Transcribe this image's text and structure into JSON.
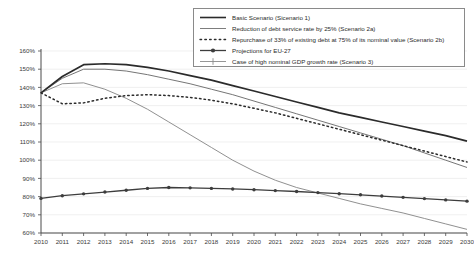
{
  "chart_data": {
    "type": "line",
    "title": "",
    "xlabel": "",
    "ylabel": "",
    "x": [
      2010,
      2011,
      2012,
      2013,
      2014,
      2015,
      2016,
      2017,
      2018,
      2019,
      2020,
      2021,
      2022,
      2023,
      2024,
      2025,
      2026,
      2027,
      2028,
      2029,
      2030
    ],
    "xlim": [
      2010,
      2030
    ],
    "ylim": [
      60,
      160
    ],
    "ytick_labels": [
      "160%",
      "150%",
      "140%",
      "130%",
      "120%",
      "110%",
      "100%",
      "90%",
      "80%",
      "70%",
      "60%"
    ],
    "ytick_values": [
      160,
      150,
      140,
      130,
      120,
      110,
      100,
      90,
      80,
      70,
      60
    ],
    "xtick_labels": [
      "2010",
      "2011",
      "2012",
      "2013",
      "2014",
      "2015",
      "2016",
      "2017",
      "2018",
      "2019",
      "2020",
      "2021",
      "2022",
      "2023",
      "2024",
      "2025",
      "2026",
      "2027",
      "2028",
      "2029",
      "2030"
    ],
    "grid": true,
    "legend_position": "top-right",
    "series": [
      {
        "name": "Basic Scenario (Sicenario 1)",
        "style": "solid-thick",
        "color": "#2b2b2b",
        "values": [
          137.0,
          146.0,
          152.5,
          153.0,
          152.5,
          151.0,
          149.0,
          146.5,
          144.0,
          141.0,
          138.0,
          135.0,
          132.0,
          129.0,
          126.0,
          123.5,
          121.0,
          118.5,
          116.0,
          113.5,
          110.5
        ]
      },
      {
        "name": "Reduction of debt service rate by 25% (Scenario 2a)",
        "style": "solid-thin",
        "color": "#6e6e6e",
        "values": [
          137.0,
          145.0,
          150.0,
          150.0,
          149.0,
          147.0,
          144.5,
          142.0,
          139.0,
          136.0,
          132.5,
          129.0,
          125.5,
          122.0,
          118.5,
          115.0,
          111.5,
          108.0,
          104.0,
          100.0,
          96.0
        ]
      },
      {
        "name": "Repurchase of 33% of existing debt at 75% of its nominal value (Scenario 2b)",
        "style": "dotted",
        "color": "#2b2b2b",
        "values": [
          137.0,
          131.0,
          131.5,
          134.0,
          135.5,
          136.0,
          135.5,
          134.5,
          133.0,
          131.0,
          128.5,
          126.0,
          123.0,
          120.0,
          117.0,
          114.0,
          111.0,
          108.0,
          105.0,
          102.0,
          99.0
        ]
      },
      {
        "name": "Projections for EU-27",
        "style": "marker-line",
        "color": "#3d3d3d",
        "values": [
          79.0,
          80.5,
          81.5,
          82.5,
          83.5,
          84.5,
          85.0,
          84.8,
          84.5,
          84.2,
          83.8,
          83.3,
          82.8,
          82.2,
          81.6,
          81.0,
          80.3,
          79.6,
          78.9,
          78.2,
          77.5
        ]
      },
      {
        "name": "Case of high nominal GDP growth rate (Scenario 3)",
        "style": "solid-light",
        "color": "#8a8a8a",
        "values": [
          137.0,
          142.0,
          142.5,
          139.0,
          134.0,
          128.0,
          121.0,
          114.0,
          107.0,
          100.0,
          94.0,
          89.0,
          85.0,
          82.0,
          79.0,
          76.0,
          73.5,
          71.0,
          68.0,
          65.0,
          62.0
        ]
      }
    ]
  },
  "legend": {
    "items": [
      {
        "label": "Basic Scenario (Sicenario 1)",
        "swatch": "solid-thick-swatch"
      },
      {
        "label": "Reduction of debt service rate by 25% (Scenario 2a)",
        "swatch": "solid-thin-swatch"
      },
      {
        "label": "Repurchase of 33% of existing debt at 75% of its nominal value (Scenario 2b)",
        "swatch": "dotted-swatch"
      },
      {
        "label": "Projections for EU-27",
        "swatch": "marker-line-swatch"
      },
      {
        "label": "Case of high nominal GDP growth rate (Scenario 3)",
        "swatch": "marker-cross-swatch"
      }
    ]
  }
}
